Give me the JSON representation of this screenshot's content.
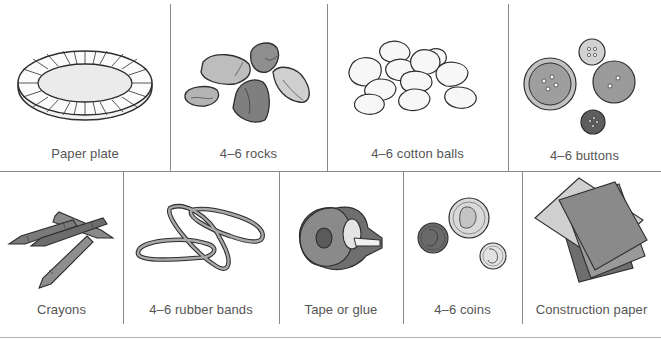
{
  "colors": {
    "background": "#ffffff",
    "divider": "#8a8a8a",
    "label_text": "#555555",
    "outline": "#2e2e2e",
    "gray_light": "#d6d6d6",
    "gray_mid": "#a8a8a8",
    "gray_dark": "#7c7c7c",
    "gray_darker": "#5e5e5e"
  },
  "top_row": {
    "items": [
      {
        "label": "Paper plate",
        "icon": "paper-plate-icon"
      },
      {
        "label": "4–6 rocks",
        "icon": "rocks-icon"
      },
      {
        "label": "4–6 cotton balls",
        "icon": "cotton-balls-icon"
      },
      {
        "label": "4–6 buttons",
        "icon": "buttons-icon"
      }
    ]
  },
  "bottom_row": {
    "items": [
      {
        "label": "Crayons",
        "icon": "crayons-icon"
      },
      {
        "label": "4–6 rubber bands",
        "icon": "rubber-bands-icon"
      },
      {
        "label": "Tape or glue",
        "icon": "tape-dispenser-icon"
      },
      {
        "label": "4–6 coins",
        "icon": "coins-icon"
      },
      {
        "label": "Construction paper",
        "icon": "construction-paper-icon"
      }
    ]
  }
}
